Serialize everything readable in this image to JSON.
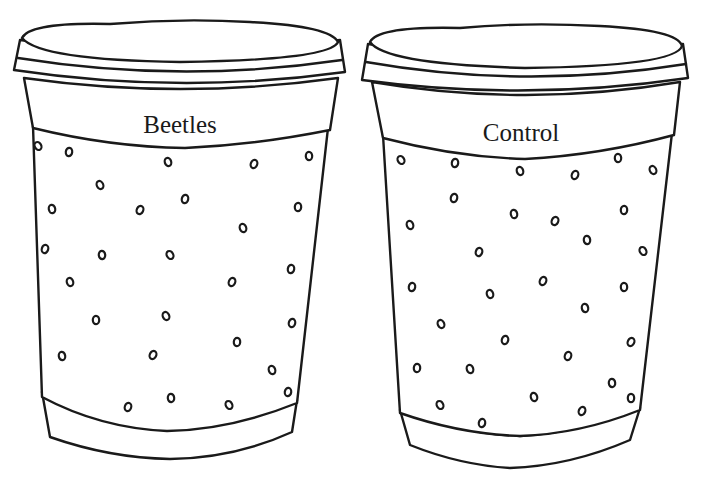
{
  "figure": {
    "colors": {
      "stroke": "#1a1a1a",
      "fill": "#ffffff",
      "background": "#ffffff"
    }
  },
  "cups": [
    {
      "id": "beetles",
      "label": "Beetles",
      "label_pos": [
        180,
        125
      ],
      "holes": [
        [
          38,
          146
        ],
        [
          69,
          152
        ],
        [
          168,
          162
        ],
        [
          254,
          164
        ],
        [
          309,
          156
        ],
        [
          100,
          185
        ],
        [
          185,
          199
        ],
        [
          52,
          209
        ],
        [
          140,
          210
        ],
        [
          298,
          207
        ],
        [
          243,
          228
        ],
        [
          45,
          249
        ],
        [
          102,
          255
        ],
        [
          170,
          255
        ],
        [
          291,
          269
        ],
        [
          70,
          282
        ],
        [
          232,
          282
        ],
        [
          96,
          320
        ],
        [
          166,
          316
        ],
        [
          292,
          323
        ],
        [
          62,
          356
        ],
        [
          153,
          355
        ],
        [
          237,
          342
        ],
        [
          272,
          370
        ],
        [
          128,
          407
        ],
        [
          171,
          398
        ],
        [
          229,
          405
        ],
        [
          288,
          392
        ]
      ]
    },
    {
      "id": "control",
      "label": "Control",
      "label_pos": [
        521,
        133
      ],
      "holes": [
        [
          401,
          160
        ],
        [
          455,
          163
        ],
        [
          520,
          171
        ],
        [
          575,
          175
        ],
        [
          618,
          158
        ],
        [
          653,
          170
        ],
        [
          454,
          198
        ],
        [
          514,
          214
        ],
        [
          555,
          221
        ],
        [
          624,
          210
        ],
        [
          410,
          225
        ],
        [
          479,
          252
        ],
        [
          587,
          240
        ],
        [
          643,
          251
        ],
        [
          412,
          287
        ],
        [
          490,
          294
        ],
        [
          543,
          281
        ],
        [
          624,
          287
        ],
        [
          441,
          324
        ],
        [
          505,
          340
        ],
        [
          585,
          308
        ],
        [
          631,
          342
        ],
        [
          417,
          368
        ],
        [
          470,
          369
        ],
        [
          568,
          356
        ],
        [
          612,
          383
        ],
        [
          440,
          405
        ],
        [
          482,
          423
        ],
        [
          534,
          397
        ],
        [
          582,
          411
        ],
        [
          631,
          398
        ]
      ]
    }
  ]
}
